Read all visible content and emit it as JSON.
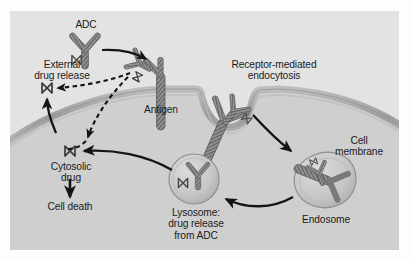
{
  "figure": {
    "panel_bg": "#e3e3e3",
    "cytoplasm_color": "#cfcfcf",
    "membrane_color": "#a9a9a9",
    "ink_color": "#1b1b1b"
  },
  "labels": {
    "adc": "ADC",
    "external_drug_release": "External\ndrug release",
    "external_drug_release_line1": "External",
    "external_drug_release_line2": "drug release",
    "antigen": "Antigen",
    "receptor_mediated_endocytosis_line1": "Receptor-mediated",
    "receptor_mediated_endocytosis_line2": "endocytosis",
    "cell_membrane_line1": "Cell",
    "cell_membrane_line2": "membrane",
    "endosome": "Endosome",
    "lysosome_line1": "Lysosome:",
    "lysosome_line2": "drug release",
    "lysosome_line3": "from ADC",
    "cytosolic_drug_line1": "Cytosolic",
    "cytosolic_drug_line2": "drug",
    "cell_death": "Cell death"
  },
  "entities": [
    {
      "name": "adc-antibody",
      "kind": "antibody-with-drug",
      "location": "extracellular-top"
    },
    {
      "name": "antigen-receptor",
      "kind": "membrane-receptor",
      "location": "membrane-left"
    },
    {
      "name": "bound-adc",
      "kind": "antibody-with-drug",
      "location": "bound-to-antigen"
    },
    {
      "name": "endocytic-pit",
      "kind": "membrane-invagination",
      "location": "membrane-center"
    },
    {
      "name": "endosome",
      "kind": "vesicle",
      "location": "cytoplasm-right"
    },
    {
      "name": "lysosome",
      "kind": "vesicle",
      "location": "cytoplasm-center"
    },
    {
      "name": "external-drug",
      "kind": "free-drug",
      "location": "extracellular-left"
    },
    {
      "name": "cytosolic-drug",
      "kind": "free-drug",
      "location": "cytoplasm-left"
    }
  ],
  "arrows": [
    {
      "name": "adc-to-antigen",
      "style": "solid",
      "from": "adc-antibody",
      "to": "antigen-receptor"
    },
    {
      "name": "adc-to-external-drug",
      "style": "dashed",
      "from": "bound-adc",
      "to": "external-drug"
    },
    {
      "name": "adc-to-cytosolic-drug",
      "style": "dashed",
      "from": "bound-adc",
      "to": "cytosolic-drug"
    },
    {
      "name": "cytosolic-to-external-drug",
      "style": "solid",
      "from": "cytosolic-drug",
      "to": "external-drug"
    },
    {
      "name": "pit-to-endosome",
      "style": "solid",
      "from": "endocytic-pit",
      "to": "endosome"
    },
    {
      "name": "endosome-to-lysosome",
      "style": "solid",
      "from": "endosome",
      "to": "lysosome"
    },
    {
      "name": "lysosome-to-cytosolic-drug",
      "style": "solid",
      "from": "lysosome",
      "to": "cytosolic-drug"
    },
    {
      "name": "cytosolic-drug-to-cell-death",
      "style": "solid",
      "from": "cytosolic-drug",
      "to": "cell-death"
    }
  ],
  "bleed_text": [
    "the blocks with these",
    "survival rate of",
    "logy agent that B",
    "indicate the expected",
    "a specific kinase to",
    "BCR a new",
    "containment",
    "in the line of",
    "a new and large",
    "that the mechanism",
    "the patient in one",
    "a small amount"
  ]
}
